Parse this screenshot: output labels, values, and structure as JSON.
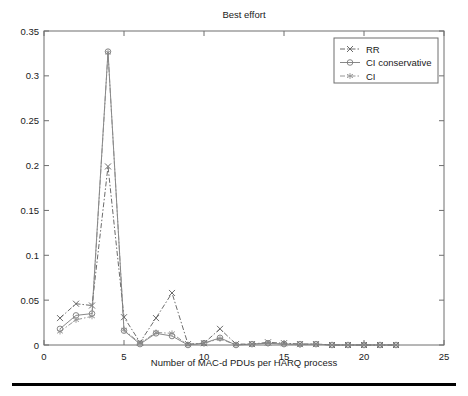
{
  "figure": {
    "background_color": "#ffffff",
    "frame_color": "#6e6e6e",
    "bottom_rule": true
  },
  "chart_data": {
    "type": "line",
    "title": "Best effort",
    "xlabel": "Number of MAC-d PDUs per HARQ process",
    "ylabel": "",
    "xlim": [
      0,
      25
    ],
    "ylim": [
      0,
      0.35
    ],
    "xticks": [
      0,
      5,
      10,
      15,
      20,
      25
    ],
    "xtick_labels": [
      "0",
      "5",
      "10",
      "15",
      "20",
      "25"
    ],
    "yticks": [
      0,
      0.05,
      0.1,
      0.15,
      0.2,
      0.25,
      0.3,
      0.35
    ],
    "ytick_labels": [
      "0",
      "0.05",
      "0.1",
      "0.15",
      "0.2",
      "0.25",
      "0.3",
      "0.35"
    ],
    "grid": false,
    "legend_position": "upper right",
    "x": [
      1,
      2,
      3,
      4,
      5,
      6,
      7,
      8,
      9,
      10,
      11,
      12,
      13,
      14,
      15,
      16,
      17,
      18,
      19,
      20,
      21,
      22
    ],
    "series": [
      {
        "name": "RR",
        "marker": "x",
        "color": "#5a5a5a",
        "linestyle": "dash-dot",
        "values": [
          0.03,
          0.046,
          0.044,
          0.199,
          0.031,
          0.003,
          0.03,
          0.058,
          0.001,
          0.002,
          0.018,
          0.001,
          0.001,
          0.003,
          0.002,
          0.001,
          0.001,
          0.0,
          0.0,
          0.0,
          0.0,
          0.0
        ]
      },
      {
        "name": "CI conservative",
        "marker": "o",
        "color": "#7a7a7a",
        "linestyle": "solid",
        "values": [
          0.018,
          0.033,
          0.035,
          0.327,
          0.016,
          0.001,
          0.013,
          0.01,
          0.0,
          0.002,
          0.008,
          0.0,
          0.001,
          0.002,
          0.001,
          0.001,
          0.001,
          0.0,
          0.0,
          0.0,
          0.0,
          0.0
        ]
      },
      {
        "name": "CI",
        "marker": "*",
        "color": "#8a8a8a",
        "linestyle": "dash-dot",
        "values": [
          0.015,
          0.028,
          0.032,
          0.326,
          0.017,
          0.002,
          0.014,
          0.013,
          0.0,
          0.002,
          0.007,
          0.0,
          0.001,
          0.002,
          0.001,
          0.0,
          0.001,
          0.0,
          0.0,
          0.0,
          0.0,
          0.0
        ]
      }
    ]
  }
}
